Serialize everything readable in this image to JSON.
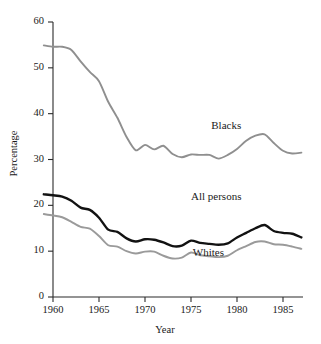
{
  "chart_data": {
    "type": "line",
    "title": "",
    "xlabel": "Year",
    "ylabel": "Percentage",
    "xlim": [
      1959,
      1987
    ],
    "ylim": [
      0,
      60
    ],
    "xticks": [
      1960,
      1965,
      1970,
      1975,
      1980,
      1985
    ],
    "xtick_labels": [
      "1960",
      "1965",
      "1970",
      "1975",
      "1980",
      "1985"
    ],
    "yticks": [
      0,
      10,
      20,
      30,
      40,
      50,
      60
    ],
    "ytick_labels": [
      "0",
      "10",
      "20",
      "30",
      "40",
      "50",
      "60"
    ],
    "grid": false,
    "legend_position": "inline-annotations",
    "x": [
      1959,
      1960,
      1961,
      1962,
      1963,
      1964,
      1965,
      1966,
      1967,
      1968,
      1969,
      1970,
      1971,
      1972,
      1973,
      1974,
      1975,
      1976,
      1977,
      1978,
      1979,
      1980,
      1981,
      1982,
      1983,
      1984,
      1985,
      1986,
      1987
    ],
    "series": [
      {
        "name": "Blacks",
        "color": "#8f8f8f",
        "label_x": 1977.2,
        "label_y": 37.2,
        "values": [
          54.9,
          54.6,
          54.6,
          53.9,
          51.4,
          49.1,
          47.1,
          42.6,
          39.1,
          34.9,
          32.0,
          33.2,
          32.2,
          33.0,
          31.2,
          30.5,
          31.1,
          31.0,
          31.0,
          30.2,
          31.0,
          32.3,
          34.1,
          35.2,
          35.5,
          33.6,
          31.9,
          31.3,
          31.5
        ]
      },
      {
        "name": "All persons",
        "color": "#121212",
        "label_x": 1975.0,
        "label_y": 21.5,
        "values": [
          22.4,
          22.2,
          21.9,
          21.0,
          19.5,
          19.0,
          17.3,
          14.7,
          14.2,
          12.8,
          12.1,
          12.6,
          12.5,
          11.9,
          11.1,
          11.2,
          12.3,
          11.8,
          11.6,
          11.4,
          11.7,
          13.0,
          14.0,
          15.0,
          15.7,
          14.4,
          14.0,
          13.8,
          13.0
        ]
      },
      {
        "name": "Whites",
        "color": "#9a9a9a",
        "label_x": 1975.2,
        "label_y": 9.4,
        "values": [
          18.1,
          17.8,
          17.4,
          16.4,
          15.3,
          14.9,
          13.3,
          11.3,
          11.0,
          10.0,
          9.5,
          9.9,
          9.9,
          9.0,
          8.4,
          8.6,
          9.7,
          9.1,
          8.9,
          8.7,
          9.0,
          10.2,
          11.1,
          12.0,
          12.1,
          11.5,
          11.4,
          11.0,
          10.5
        ]
      }
    ]
  }
}
